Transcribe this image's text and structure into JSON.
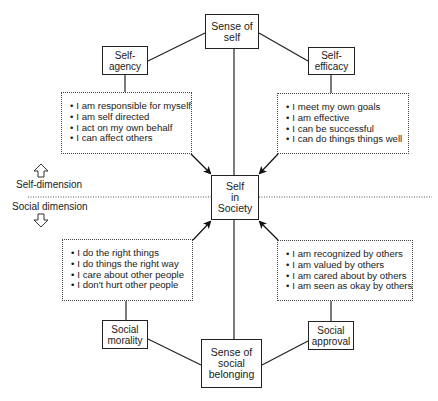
{
  "center": {
    "label": "Self\nin\nSociety"
  },
  "top": {
    "label": "Sense of\nself"
  },
  "bottom": {
    "label": "Sense of\nsocial\nbelonging"
  },
  "nodes": {
    "self_agency": {
      "label": "Self-\nagency",
      "items": [
        "I am responsible for myself",
        "I am self directed",
        "I act on my own behalf",
        "I can affect others"
      ]
    },
    "self_efficacy": {
      "label": "Self-\nefficacy",
      "items": [
        "I meet my own goals",
        "I am effective",
        "I can be successful",
        "I can do things things well"
      ]
    },
    "social_morality": {
      "label": "Social\nmorality",
      "items": [
        "I do the right things",
        "I do things the right way",
        "I care about other people",
        "I don't hurt other people"
      ]
    },
    "social_approval": {
      "label": "Social\napproval",
      "items": [
        "I am recognized by others",
        "I am valued by others",
        "I am cared about by others",
        "I am seen as okay by others"
      ]
    }
  },
  "dimensions": {
    "upper": {
      "label": "Self-dimension",
      "icon": "arrow-up-outline"
    },
    "lower": {
      "label": "Social dimension",
      "icon": "arrow-down-outline"
    }
  }
}
